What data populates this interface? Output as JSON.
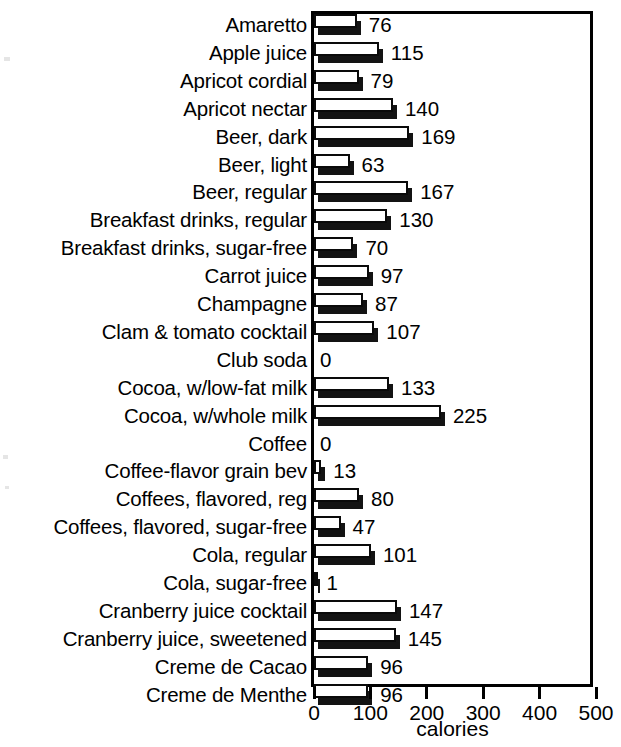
{
  "chart_data": {
    "type": "bar",
    "orientation": "horizontal",
    "title": "",
    "xlabel": "calories",
    "ylabel": "",
    "xlim": [
      0,
      500
    ],
    "xticks": [
      0,
      100,
      200,
      300,
      400,
      500
    ],
    "xtick_labels": [
      "0",
      "100",
      "200",
      "300",
      "400",
      "500"
    ],
    "grid": false,
    "legend": "none",
    "bar_style": "3d-white-face-black-shadow",
    "categories": [
      "Amaretto",
      "Apple juice",
      "Apricot cordial",
      "Apricot nectar",
      "Beer, dark",
      "Beer, light",
      "Beer, regular",
      "Breakfast drinks, regular",
      "Breakfast drinks, sugar-free",
      "Carrot juice",
      "Champagne",
      "Clam & tomato cocktail",
      "Club soda",
      "Cocoa, w/low-fat milk",
      "Cocoa, w/whole milk",
      "Coffee",
      "Coffee-flavor grain bev",
      "Coffees, flavored, reg",
      "Coffees, flavored, sugar-free",
      "Cola, regular",
      "Cola, sugar-free",
      "Cranberry juice cocktail",
      "Cranberry juice, sweetened",
      "Creme de Cacao",
      "Creme de Menthe"
    ],
    "values": [
      76,
      115,
      79,
      140,
      169,
      63,
      167,
      130,
      70,
      97,
      87,
      107,
      0,
      133,
      225,
      0,
      13,
      80,
      47,
      101,
      1,
      147,
      145,
      96,
      96
    ],
    "value_labels": [
      "76",
      "115",
      "79",
      "140",
      "169",
      "63",
      "167",
      "130",
      "70",
      "97",
      "87",
      "107",
      "0",
      "133",
      "225",
      "0",
      "13",
      "80",
      "47",
      "101",
      "1",
      "147",
      "145",
      "96",
      "96"
    ],
    "colors": {
      "bar_face": "#ffffff",
      "bar_outline": "#0a0a0a",
      "bar_shadow": "#131313",
      "axis": "#000000",
      "text": "#000000",
      "background": "#ffffff"
    }
  }
}
